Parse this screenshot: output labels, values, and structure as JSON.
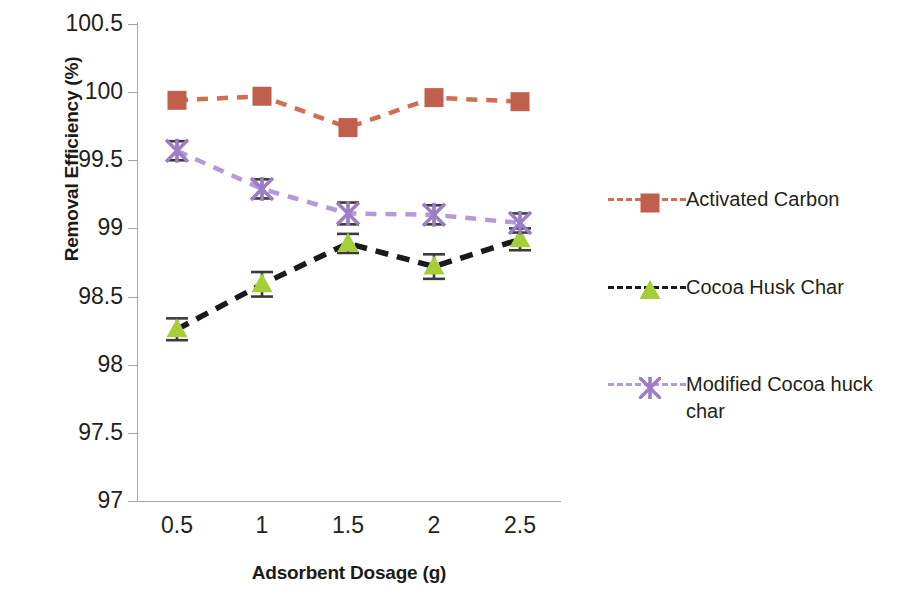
{
  "chart_data": {
    "type": "line",
    "title": "",
    "xlabel": "Adsorbent Dosage (g)",
    "ylabel": "Removal Efficiency (%)",
    "x": [
      0.5,
      1,
      1.5,
      2,
      2.5
    ],
    "x_tick_labels": [
      "0.5",
      "1",
      "1.5",
      "2",
      "2.5"
    ],
    "xlim": [
      0.25,
      2.75
    ],
    "ylim": [
      97,
      100.5
    ],
    "y_tick_labels": [
      "100.5",
      "100",
      "99.5",
      "99",
      "98.5",
      "98",
      "97.5",
      "97"
    ],
    "y_ticks": [
      100.5,
      100,
      99.5,
      99,
      98.5,
      98,
      97.5,
      97
    ],
    "grid": false,
    "legend_position": "right",
    "series": [
      {
        "name": "Activated Carbon",
        "color": "#c0604c",
        "line_color": "#cf6f52",
        "marker": "square",
        "line_style": "dashed",
        "values": [
          99.94,
          99.97,
          99.74,
          99.96,
          99.93
        ],
        "errors": [
          0,
          0,
          0,
          0,
          0
        ]
      },
      {
        "name": "Cocoa Husk Char",
        "color": "#a6ce39",
        "line_color": "#1a1a1a",
        "marker": "triangle",
        "line_style": "dashed",
        "values": [
          98.26,
          98.59,
          98.89,
          98.72,
          98.92
        ],
        "errors": [
          0.08,
          0.09,
          0.07,
          0.09,
          0.08
        ]
      },
      {
        "name": "Modified Cocoa huck char",
        "color": "#9d7ec4",
        "line_color": "#b49bd8",
        "marker": "x",
        "line_style": "dashed",
        "values": [
          99.57,
          99.29,
          99.11,
          99.1,
          99.04
        ],
        "errors": [
          0.07,
          0.07,
          0.08,
          0.07,
          0.07
        ]
      }
    ]
  },
  "legend": {
    "entries": [
      {
        "label": "Activated Carbon"
      },
      {
        "label": "Cocoa Husk Char"
      },
      {
        "label": "Modified Cocoa huck char"
      }
    ]
  },
  "axes": {
    "y_title": "Removal Efficiency (%)",
    "x_title": "Adsorbent Dosage (g)"
  },
  "colors": {
    "activated_carbon": "#c0604c",
    "cocoa_husk_char_marker": "#a6ce39",
    "cocoa_husk_char_line": "#1a1a1a",
    "modified_cocoa_huck_char": "#9d7ec4",
    "axis": "#a6a6a6",
    "text": "#231f20",
    "background": "#ffffff"
  }
}
